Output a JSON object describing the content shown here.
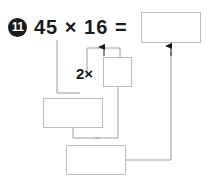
{
  "problem": {
    "number": "11",
    "badge_name": "problem-number-11",
    "equation": {
      "left_operand": "45",
      "operator": "×",
      "right_operand": "16",
      "equals": "=",
      "full_text": "45 × 16 ="
    },
    "strategy_label": {
      "factor": "2",
      "operator": "×",
      "full_text": "2×"
    }
  },
  "answer_boxes": [
    {
      "id": "box-result",
      "name": "answer-box-result",
      "value": "",
      "placeholder": ""
    },
    {
      "id": "box-double",
      "name": "answer-box-double",
      "value": "",
      "placeholder": ""
    },
    {
      "id": "box-mid",
      "name": "answer-box-partial-left",
      "value": "",
      "placeholder": ""
    },
    {
      "id": "box-bottom",
      "name": "answer-box-partial-lower",
      "value": "",
      "placeholder": ""
    }
  ],
  "connectors": [
    {
      "name": "connector-45-to-partial-left",
      "arrow": false
    },
    {
      "name": "connector-bracket-to-result",
      "arrow": true
    },
    {
      "name": "connector-double-to-lower",
      "arrow": false
    },
    {
      "name": "connector-partial-left-to-lower",
      "arrow": false
    },
    {
      "name": "connector-lower-to-result",
      "arrow": true
    }
  ],
  "colors": {
    "ink": "#1a1a1a",
    "box_border": "#b9bcc0",
    "connector_line": "#9aa0a6",
    "arrow_fill": "#1a1a1a",
    "badge_fill": "#1a1a1a",
    "badge_text": "#ffffff",
    "page_background": "#ffffff"
  }
}
